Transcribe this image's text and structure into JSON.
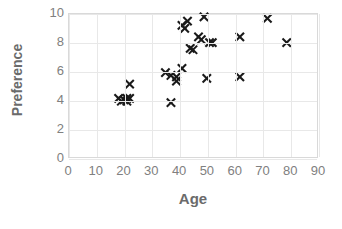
{
  "chart_data": {
    "type": "scatter",
    "title": "",
    "xlabel": "Age",
    "ylabel": "Preference",
    "xlim": [
      0,
      90
    ],
    "ylim": [
      0,
      10
    ],
    "xticks": [
      0,
      10,
      20,
      30,
      40,
      50,
      60,
      70,
      80,
      90
    ],
    "yticks": [
      0,
      2,
      4,
      6,
      8,
      10
    ],
    "grid": true,
    "legend": false,
    "marker": "x",
    "marker_color": "#1a1a1a",
    "points": [
      {
        "x": 18,
        "y": 4.1
      },
      {
        "x": 19,
        "y": 3.9
      },
      {
        "x": 20,
        "y": 4.0
      },
      {
        "x": 21,
        "y": 4.1
      },
      {
        "x": 21,
        "y": 3.9
      },
      {
        "x": 22,
        "y": 4.1
      },
      {
        "x": 22,
        "y": 5.1
      },
      {
        "x": 35,
        "y": 5.9
      },
      {
        "x": 37,
        "y": 3.8
      },
      {
        "x": 37,
        "y": 5.7
      },
      {
        "x": 39,
        "y": 5.6
      },
      {
        "x": 39,
        "y": 5.3
      },
      {
        "x": 41,
        "y": 6.2
      },
      {
        "x": 41,
        "y": 9.2
      },
      {
        "x": 42,
        "y": 9.0
      },
      {
        "x": 43,
        "y": 9.5
      },
      {
        "x": 44,
        "y": 7.6
      },
      {
        "x": 45,
        "y": 7.5
      },
      {
        "x": 47,
        "y": 8.4
      },
      {
        "x": 48,
        "y": 8.2
      },
      {
        "x": 49,
        "y": 9.8
      },
      {
        "x": 50,
        "y": 5.5
      },
      {
        "x": 51,
        "y": 8.0
      },
      {
        "x": 52,
        "y": 8.0
      },
      {
        "x": 62,
        "y": 8.4
      },
      {
        "x": 62,
        "y": 5.6
      },
      {
        "x": 72,
        "y": 9.7
      },
      {
        "x": 79,
        "y": 8.0
      }
    ]
  }
}
